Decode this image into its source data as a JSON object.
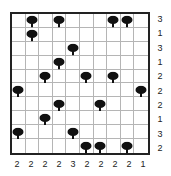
{
  "puzzle": {
    "type": "tents",
    "size": {
      "rows": 10,
      "cols": 10
    },
    "trees": [
      [
        0,
        1
      ],
      [
        0,
        3
      ],
      [
        0,
        7
      ],
      [
        0,
        8
      ],
      [
        1,
        1
      ],
      [
        2,
        4
      ],
      [
        3,
        3
      ],
      [
        4,
        2
      ],
      [
        4,
        5
      ],
      [
        4,
        7
      ],
      [
        5,
        0
      ],
      [
        5,
        9
      ],
      [
        6,
        3
      ],
      [
        6,
        6
      ],
      [
        7,
        2
      ],
      [
        8,
        0
      ],
      [
        8,
        4
      ],
      [
        9,
        5
      ],
      [
        9,
        6
      ],
      [
        9,
        8
      ]
    ],
    "row_clues": [
      "3",
      "1",
      "3",
      "1",
      "2",
      "2",
      "2",
      "1",
      "3",
      "2"
    ],
    "col_clues": [
      "2",
      "2",
      "2",
      "2",
      "3",
      "2",
      "2",
      "2",
      "2",
      "1"
    ],
    "icons": {
      "tree": "tree-icon"
    },
    "colors": {
      "tree": "#111111",
      "grid_line": "#b5b5b5",
      "border": "#222222",
      "clue_text": "#222222"
    }
  }
}
